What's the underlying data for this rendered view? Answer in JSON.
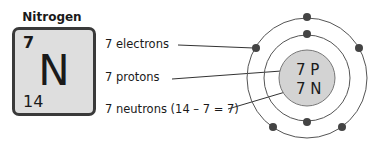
{
  "element": {
    "name": "Nitrogen",
    "atomic_number": "7",
    "symbol": "N",
    "mass_number": "14"
  },
  "labels": {
    "electrons": "7 electrons",
    "protons": "7 protons",
    "neutrons": "7 neutrons (14 – 7 = 7)"
  },
  "nucleus": {
    "protons": "7 P",
    "neutrons": "7 N"
  },
  "colors": {
    "tile_bg": "#dedede",
    "nucleus_bg": "#d3d3d3",
    "electron": "#444444"
  }
}
